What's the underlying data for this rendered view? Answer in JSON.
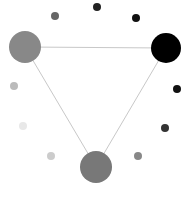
{
  "diagram": {
    "background": "#ffffff",
    "edge_color": "#c8c8c8",
    "nodes": [
      {
        "id": "left",
        "cx": 25,
        "cy": 47,
        "r": 16,
        "color": "#888888"
      },
      {
        "id": "right",
        "cx": 166,
        "cy": 48,
        "r": 15,
        "color": "#000000"
      },
      {
        "id": "bottom",
        "cx": 96,
        "cy": 167,
        "r": 16,
        "color": "#787878"
      }
    ],
    "edges": [
      {
        "from": "left",
        "to": "right"
      },
      {
        "from": "left",
        "to": "bottom"
      },
      {
        "from": "right",
        "to": "bottom"
      }
    ],
    "dots": [
      {
        "cx": 97,
        "cy": 7,
        "r": 4,
        "color": "#222222"
      },
      {
        "cx": 136,
        "cy": 18,
        "r": 4,
        "color": "#111111"
      },
      {
        "cx": 55,
        "cy": 16,
        "r": 4,
        "color": "#666666"
      },
      {
        "cx": 177,
        "cy": 89,
        "r": 4,
        "color": "#111111"
      },
      {
        "cx": 165,
        "cy": 128,
        "r": 4,
        "color": "#333333"
      },
      {
        "cx": 138,
        "cy": 156,
        "r": 4,
        "color": "#888888"
      },
      {
        "cx": 14,
        "cy": 86,
        "r": 4,
        "color": "#bbbbbb"
      },
      {
        "cx": 23,
        "cy": 126,
        "r": 4,
        "color": "#e8e8e8"
      },
      {
        "cx": 51,
        "cy": 156,
        "r": 4,
        "color": "#cccccc"
      }
    ]
  }
}
